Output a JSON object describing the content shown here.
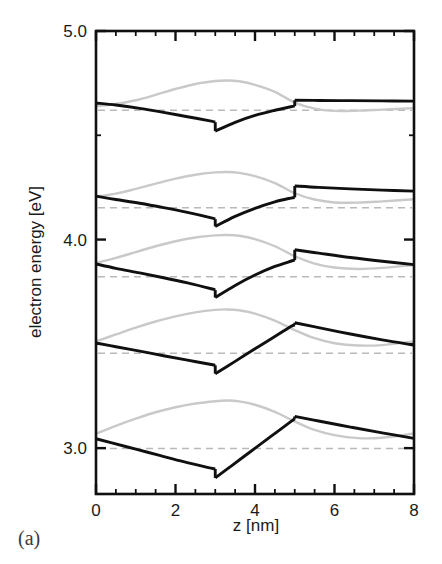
{
  "figure": {
    "panel_label": "(a)",
    "background_color": "#ffffff"
  },
  "axes": {
    "x": {
      "label": "z   [nm]",
      "variable": "z",
      "unit": "nm",
      "min": 0,
      "max": 8,
      "major_ticks": [
        0,
        2,
        4,
        6,
        8
      ],
      "tick_labels": [
        "0",
        "2",
        "4",
        "6",
        "8"
      ],
      "minor_tick_step": 0.5
    },
    "y": {
      "label": "electron energy  [eV]",
      "variable": "electron energy",
      "unit": "eV",
      "min": 2.78,
      "max": 5.0,
      "major_ticks": [
        3.0,
        4.0,
        5.0
      ],
      "tick_labels": [
        "3.0",
        "4.0",
        "5.0"
      ],
      "minor_ticks": [
        3.5,
        4.5
      ]
    }
  },
  "colors": {
    "band_edge": "#101010",
    "wavefunction": "#c9c9c9",
    "level_dashed": "#b9b9b9",
    "frame": "#101010",
    "text": "#1a1a1a",
    "panel_label": "#3a3a3a"
  },
  "chart_data": {
    "type": "line",
    "title": "",
    "subtitle": "",
    "xlabel": "z   [nm]",
    "ylabel": "electron energy  [eV]",
    "xlim": [
      0,
      8
    ],
    "ylim": [
      2.78,
      5.0
    ],
    "grid": false,
    "legend": "none",
    "annotations": [
      "(a)"
    ],
    "structure": {
      "well_left_nm": 3.0,
      "well_right_nm": 5.0,
      "note": "Abrupt band-edge steps at z = 3 nm and z = 5 nm"
    },
    "series": [
      {
        "name": "band-edge-1",
        "kind": "band-edge",
        "x": [
          0.0,
          0.4,
          1.0,
          1.6,
          2.2,
          2.8,
          3.0,
          3.0,
          3.4,
          3.9,
          4.4,
          4.9,
          5.0,
          5.0,
          5.6,
          6.4,
          7.2,
          8.0
        ],
        "values": [
          3.045,
          3.025,
          2.995,
          2.965,
          2.935,
          2.908,
          2.9,
          2.857,
          2.914,
          2.985,
          3.056,
          3.127,
          3.141,
          3.152,
          3.13,
          3.101,
          3.073,
          3.047
        ]
      },
      {
        "name": "wavefunction-1",
        "kind": "wavefunction",
        "x": [
          0.0,
          0.5,
          1.0,
          1.5,
          2.0,
          2.5,
          3.0,
          3.3,
          3.6,
          4.0,
          4.5,
          5.0,
          5.5,
          6.0,
          6.6,
          7.2,
          8.0
        ],
        "values": [
          3.069,
          3.107,
          3.141,
          3.172,
          3.196,
          3.214,
          3.225,
          3.228,
          3.224,
          3.208,
          3.174,
          3.128,
          3.087,
          3.062,
          3.048,
          3.05,
          3.07
        ]
      },
      {
        "name": "level-1",
        "kind": "eigenlevel",
        "energy": 2.998
      },
      {
        "name": "band-edge-2",
        "kind": "band-edge",
        "x": [
          0.0,
          0.5,
          1.1,
          1.7,
          2.3,
          2.9,
          3.0,
          3.0,
          3.5,
          4.0,
          4.5,
          4.9,
          5.0,
          5.0,
          5.6,
          6.4,
          7.2,
          8.0
        ],
        "values": [
          3.504,
          3.486,
          3.465,
          3.443,
          3.422,
          3.401,
          3.397,
          3.357,
          3.416,
          3.476,
          3.535,
          3.583,
          3.591,
          3.601,
          3.578,
          3.547,
          3.519,
          3.494
        ]
      },
      {
        "name": "wavefunction-2",
        "kind": "wavefunction",
        "x": [
          0.0,
          0.5,
          1.0,
          1.5,
          2.0,
          2.5,
          3.0,
          3.3,
          3.6,
          4.0,
          4.5,
          5.0,
          5.5,
          6.0,
          6.6,
          7.2,
          8.0
        ],
        "values": [
          3.512,
          3.545,
          3.578,
          3.607,
          3.632,
          3.651,
          3.663,
          3.665,
          3.661,
          3.645,
          3.611,
          3.566,
          3.527,
          3.503,
          3.492,
          3.494,
          3.512
        ]
      },
      {
        "name": "level-2",
        "kind": "eigenlevel",
        "energy": 3.455
      },
      {
        "name": "band-edge-3",
        "kind": "band-edge",
        "x": [
          0.0,
          0.5,
          1.1,
          1.7,
          2.3,
          2.9,
          3.0,
          3.0,
          3.5,
          4.0,
          4.5,
          4.9,
          5.0,
          5.0,
          5.6,
          6.4,
          7.2,
          8.0
        ],
        "values": [
          3.883,
          3.862,
          3.84,
          3.817,
          3.792,
          3.764,
          3.758,
          3.722,
          3.78,
          3.83,
          3.871,
          3.896,
          3.901,
          3.951,
          3.935,
          3.914,
          3.896,
          3.88
        ]
      },
      {
        "name": "wavefunction-3",
        "kind": "wavefunction",
        "x": [
          0.0,
          0.5,
          1.0,
          1.5,
          2.0,
          2.5,
          3.0,
          3.3,
          3.6,
          4.0,
          4.5,
          5.0,
          5.5,
          6.0,
          6.6,
          7.2,
          8.0
        ],
        "values": [
          3.888,
          3.912,
          3.94,
          3.968,
          3.992,
          4.01,
          4.02,
          4.022,
          4.018,
          4.002,
          3.968,
          3.92,
          3.885,
          3.866,
          3.859,
          3.864,
          3.878
        ]
      },
      {
        "name": "level-3",
        "kind": "eigenlevel",
        "energy": 3.822
      },
      {
        "name": "band-edge-4",
        "kind": "band-edge",
        "x": [
          0.0,
          0.5,
          1.1,
          1.7,
          2.3,
          2.9,
          3.0,
          3.0,
          3.5,
          4.0,
          4.5,
          4.9,
          5.0,
          5.0,
          5.6,
          6.4,
          7.2,
          8.0
        ],
        "values": [
          4.208,
          4.192,
          4.174,
          4.153,
          4.13,
          4.104,
          4.098,
          4.063,
          4.111,
          4.15,
          4.181,
          4.199,
          4.202,
          4.257,
          4.25,
          4.243,
          4.237,
          4.232
        ]
      },
      {
        "name": "wavefunction-4",
        "kind": "wavefunction",
        "x": [
          0.0,
          0.5,
          1.0,
          1.5,
          2.0,
          2.5,
          3.0,
          3.3,
          3.6,
          4.0,
          4.5,
          5.0,
          5.5,
          6.0,
          6.6,
          7.2,
          8.0
        ],
        "values": [
          4.205,
          4.22,
          4.243,
          4.268,
          4.292,
          4.311,
          4.322,
          4.324,
          4.32,
          4.304,
          4.271,
          4.222,
          4.192,
          4.178,
          4.177,
          4.183,
          4.193
        ]
      },
      {
        "name": "level-4",
        "kind": "eigenlevel",
        "energy": 4.152
      },
      {
        "name": "band-edge-5",
        "kind": "band-edge",
        "x": [
          0.0,
          0.5,
          1.1,
          1.7,
          2.3,
          2.9,
          3.0,
          3.0,
          3.5,
          4.0,
          4.5,
          4.9,
          5.0,
          5.0,
          5.6,
          6.4,
          7.2,
          8.0
        ],
        "values": [
          4.655,
          4.645,
          4.629,
          4.61,
          4.589,
          4.568,
          4.563,
          4.52,
          4.562,
          4.595,
          4.62,
          4.637,
          4.64,
          4.668,
          4.667,
          4.666,
          4.665,
          4.664
        ]
      },
      {
        "name": "wavefunction-5",
        "kind": "wavefunction",
        "x": [
          0.0,
          0.5,
          1.0,
          1.5,
          2.0,
          2.5,
          3.0,
          3.3,
          3.6,
          4.0,
          4.5,
          5.0,
          5.5,
          6.0,
          6.6,
          7.2,
          8.0
        ],
        "values": [
          4.64,
          4.65,
          4.668,
          4.694,
          4.722,
          4.746,
          4.76,
          4.763,
          4.759,
          4.742,
          4.708,
          4.657,
          4.628,
          4.617,
          4.618,
          4.623,
          4.63
        ]
      },
      {
        "name": "level-5",
        "kind": "eigenlevel",
        "energy": 4.62
      }
    ]
  }
}
